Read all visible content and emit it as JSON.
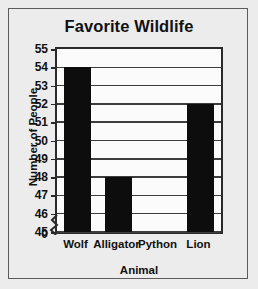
{
  "chart_data": {
    "type": "bar",
    "title": "Favorite Wildlife",
    "xlabel": "Animal",
    "ylabel": "Number of People",
    "categories": [
      "Wolf",
      "Alligator",
      "Python",
      "Lion"
    ],
    "values": [
      54,
      48,
      45,
      52
    ],
    "ytick_labels": [
      "55",
      "54",
      "53",
      "52",
      "51",
      "50",
      "49",
      "48",
      "47",
      "46",
      "45"
    ],
    "ytick_values": [
      55,
      54,
      53,
      52,
      51,
      50,
      49,
      48,
      47,
      46,
      45
    ],
    "ylim": [
      45,
      55
    ],
    "axis_break": true,
    "axis_break_label": "0",
    "grid": true,
    "legend": false,
    "colors": {
      "bar": "#0d0d0d",
      "plot_background": "#fbfbfb",
      "figure_background": "#ececec",
      "gridline": "#3d3d3d",
      "axis": "#2a2a2a",
      "text": "#111111",
      "frame_border": "#5c5c5c"
    }
  }
}
